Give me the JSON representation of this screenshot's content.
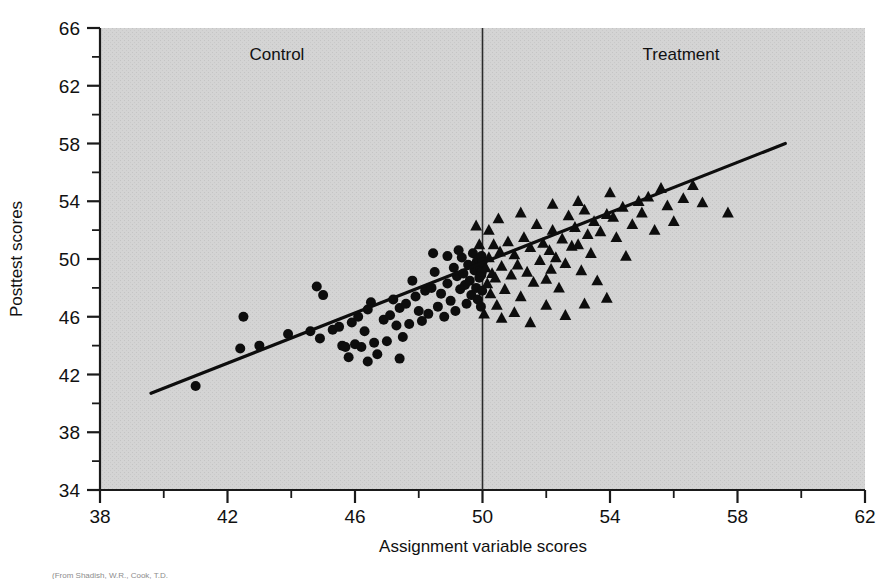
{
  "figure": {
    "background_color": "#ffffff",
    "plot_background_color": "#d2d2d2",
    "axis_color": "#1a1a1a",
    "marker_color": "#0d0d0d",
    "regression_line_color": "#0d0d0d",
    "cutoff_line_color": "#2b2b2b"
  },
  "labels": {
    "control": "Control",
    "treatment": "Treatment",
    "caption": "(From Shadish, W.R., Cook, T.D."
  },
  "chart_data": {
    "type": "scatter",
    "title": "",
    "subtitle": "",
    "xlabel": "Assignment variable scores",
    "ylabel": "Posttest scores",
    "xlim": [
      38,
      62
    ],
    "ylim": [
      34,
      66
    ],
    "xticks": [
      38,
      42,
      46,
      50,
      54,
      58,
      62
    ],
    "yticks": [
      66,
      62,
      58,
      54,
      50,
      46,
      42,
      38,
      34
    ],
    "xminor_step": 2,
    "yminor_step": 2,
    "grid": false,
    "legend_position": "none",
    "annotations": [
      {
        "text": "Control",
        "x": 43.5,
        "y": 64.2,
        "note": "label for left of cutoff"
      },
      {
        "text": "Treatment",
        "x": 56.3,
        "y": 64.2,
        "note": "label for right of cutoff"
      }
    ],
    "cutoff": {
      "x": 50,
      "label": "assignment cutoff",
      "style": "vertical line"
    },
    "regression_line": {
      "x_start": 39.6,
      "y_start": 40.7,
      "x_end": 59.5,
      "y_end": 58.0,
      "slope": 0.869,
      "intercept": 6.3
    },
    "series": [
      {
        "name": "Control",
        "marker": "circle",
        "color": "#0d0d0d",
        "points": [
          [
            41.0,
            41.2
          ],
          [
            42.4,
            43.8
          ],
          [
            42.5,
            46.0
          ],
          [
            43.9,
            44.8
          ],
          [
            44.6,
            45.0
          ],
          [
            44.8,
            48.1
          ],
          [
            44.9,
            44.5
          ],
          [
            45.3,
            45.1
          ],
          [
            45.5,
            45.3
          ],
          [
            45.6,
            44.0
          ],
          [
            45.7,
            43.9
          ],
          [
            45.8,
            43.2
          ],
          [
            45.9,
            45.6
          ],
          [
            46.0,
            44.1
          ],
          [
            46.1,
            46.0
          ],
          [
            46.2,
            43.9
          ],
          [
            46.3,
            45.0
          ],
          [
            46.4,
            46.5
          ],
          [
            46.5,
            47.0
          ],
          [
            46.6,
            44.2
          ],
          [
            46.7,
            43.4
          ],
          [
            46.9,
            45.8
          ],
          [
            47.0,
            44.3
          ],
          [
            47.1,
            46.1
          ],
          [
            47.2,
            47.2
          ],
          [
            47.3,
            45.4
          ],
          [
            47.4,
            46.6
          ],
          [
            47.5,
            44.6
          ],
          [
            47.6,
            46.9
          ],
          [
            47.7,
            45.5
          ],
          [
            47.8,
            48.5
          ],
          [
            47.9,
            47.4
          ],
          [
            48.0,
            46.4
          ],
          [
            48.1,
            45.7
          ],
          [
            48.2,
            47.8
          ],
          [
            48.3,
            46.2
          ],
          [
            48.4,
            48.0
          ],
          [
            48.5,
            49.1
          ],
          [
            48.6,
            46.7
          ],
          [
            48.7,
            47.6
          ],
          [
            48.8,
            46.0
          ],
          [
            48.9,
            48.3
          ],
          [
            49.0,
            47.1
          ],
          [
            49.1,
            49.4
          ],
          [
            49.15,
            46.4
          ],
          [
            49.2,
            48.8
          ],
          [
            49.3,
            47.9
          ],
          [
            49.35,
            50.1
          ],
          [
            49.4,
            49.0
          ],
          [
            49.45,
            48.2
          ],
          [
            49.5,
            46.9
          ],
          [
            49.55,
            49.6
          ],
          [
            49.6,
            48.5
          ],
          [
            49.65,
            47.5
          ],
          [
            49.7,
            50.4
          ],
          [
            49.75,
            49.2
          ],
          [
            49.8,
            48.0
          ],
          [
            49.82,
            49.8
          ],
          [
            49.85,
            47.2
          ],
          [
            49.88,
            50.0
          ],
          [
            49.9,
            48.7
          ],
          [
            49.92,
            49.5
          ],
          [
            49.95,
            46.7
          ],
          [
            49.96,
            48.9
          ],
          [
            49.97,
            50.2
          ],
          [
            49.98,
            49.1
          ],
          [
            49.99,
            47.8
          ],
          [
            50.0,
            49.8
          ],
          [
            48.45,
            50.4
          ],
          [
            48.9,
            50.2
          ],
          [
            49.25,
            50.6
          ],
          [
            47.4,
            43.1
          ],
          [
            46.4,
            42.9
          ],
          [
            45.0,
            47.5
          ],
          [
            43.0,
            44.0
          ]
        ]
      },
      {
        "name": "Treatment",
        "marker": "triangle",
        "color": "#0d0d0d",
        "points": [
          [
            50.1,
            49.4
          ],
          [
            50.15,
            48.3
          ],
          [
            50.2,
            50.1
          ],
          [
            50.25,
            47.6
          ],
          [
            50.3,
            49.0
          ],
          [
            50.35,
            51.0
          ],
          [
            50.4,
            48.7
          ],
          [
            50.45,
            46.8
          ],
          [
            50.5,
            52.8
          ],
          [
            50.55,
            50.5
          ],
          [
            50.6,
            49.5
          ],
          [
            50.7,
            47.9
          ],
          [
            50.8,
            51.2
          ],
          [
            50.9,
            48.9
          ],
          [
            51.0,
            50.3
          ],
          [
            51.1,
            49.6
          ],
          [
            51.2,
            47.4
          ],
          [
            51.3,
            51.5
          ],
          [
            51.4,
            49.1
          ],
          [
            51.5,
            50.8
          ],
          [
            51.6,
            48.4
          ],
          [
            51.7,
            52.4
          ],
          [
            51.8,
            49.9
          ],
          [
            51.9,
            51.1
          ],
          [
            52.0,
            48.6
          ],
          [
            52.1,
            50.6
          ],
          [
            52.15,
            49.3
          ],
          [
            52.2,
            52.0
          ],
          [
            52.3,
            50.1
          ],
          [
            52.4,
            48.0
          ],
          [
            52.5,
            51.4
          ],
          [
            52.6,
            49.7
          ],
          [
            52.7,
            53.0
          ],
          [
            52.8,
            50.9
          ],
          [
            52.9,
            52.2
          ],
          [
            53.0,
            51.0
          ],
          [
            53.1,
            49.2
          ],
          [
            53.2,
            53.4
          ],
          [
            53.3,
            51.7
          ],
          [
            53.4,
            50.4
          ],
          [
            53.5,
            52.6
          ],
          [
            53.6,
            48.5
          ],
          [
            53.7,
            51.9
          ],
          [
            53.9,
            53.1
          ],
          [
            54.0,
            54.6
          ],
          [
            54.1,
            52.9
          ],
          [
            54.2,
            51.5
          ],
          [
            54.4,
            53.6
          ],
          [
            54.5,
            50.2
          ],
          [
            54.7,
            52.4
          ],
          [
            54.9,
            54.0
          ],
          [
            55.0,
            53.2
          ],
          [
            55.2,
            54.3
          ],
          [
            55.4,
            52.0
          ],
          [
            55.6,
            54.9
          ],
          [
            55.8,
            53.7
          ],
          [
            56.0,
            52.6
          ],
          [
            56.3,
            54.2
          ],
          [
            56.6,
            55.1
          ],
          [
            56.9,
            53.9
          ],
          [
            57.7,
            53.2
          ],
          [
            50.05,
            46.2
          ],
          [
            50.6,
            45.9
          ],
          [
            51.0,
            46.3
          ],
          [
            51.5,
            45.6
          ],
          [
            52.0,
            46.8
          ],
          [
            52.6,
            46.1
          ],
          [
            53.2,
            46.9
          ],
          [
            53.9,
            47.3
          ],
          [
            51.2,
            53.2
          ],
          [
            52.2,
            53.8
          ],
          [
            53.0,
            54.0
          ],
          [
            49.8,
            52.3
          ],
          [
            49.9,
            51.0
          ],
          [
            50.2,
            52.0
          ]
        ]
      }
    ]
  }
}
